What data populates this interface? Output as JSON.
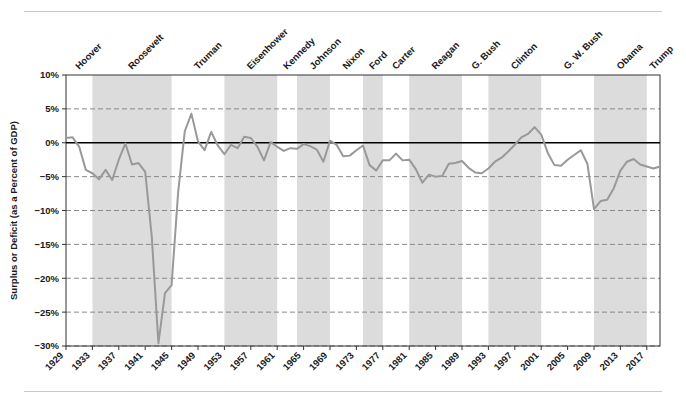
{
  "chart_data": {
    "type": "line",
    "title": "",
    "xlabel": "",
    "ylabel": "Surplus or Deficit (as a Percent of GDP)",
    "ylim": [
      -30,
      10
    ],
    "xlim": [
      1929,
      2019
    ],
    "grid": true,
    "legend_position": "none",
    "y_ticks": [
      "10%",
      "5%",
      "0%",
      "-5%",
      "-10%",
      "-15%",
      "-20%",
      "-25%",
      "-30%"
    ],
    "y_tick_values": [
      10,
      5,
      0,
      -5,
      -10,
      -15,
      -20,
      -25,
      -30
    ],
    "x_ticks": [
      "1929",
      "1933",
      "1937",
      "1941",
      "1945",
      "1949",
      "1953",
      "1957",
      "1961",
      "1965",
      "1969",
      "1973",
      "1977",
      "1981",
      "1985",
      "1989",
      "1993",
      "1997",
      "2001",
      "2005",
      "2009",
      "2013",
      "2017"
    ],
    "x_tick_values": [
      1929,
      1933,
      1937,
      1941,
      1945,
      1949,
      1953,
      1957,
      1961,
      1965,
      1969,
      1973,
      1977,
      1981,
      1985,
      1989,
      1993,
      1997,
      2001,
      2005,
      2009,
      2013,
      2017
    ],
    "series": [
      {
        "name": "Surplus or Deficit (as a Percent of GDP)",
        "color": "#999999",
        "x": [
          1929,
          1930,
          1931,
          1932,
          1933,
          1934,
          1935,
          1936,
          1937,
          1938,
          1939,
          1940,
          1941,
          1942,
          1943,
          1944,
          1945,
          1946,
          1947,
          1948,
          1949,
          1950,
          1951,
          1952,
          1953,
          1954,
          1955,
          1956,
          1957,
          1958,
          1959,
          1960,
          1961,
          1962,
          1963,
          1964,
          1965,
          1966,
          1967,
          1968,
          1969,
          1970,
          1971,
          1972,
          1973,
          1974,
          1975,
          1976,
          1977,
          1978,
          1979,
          1980,
          1981,
          1982,
          1983,
          1984,
          1985,
          1986,
          1987,
          1988,
          1989,
          1990,
          1991,
          1992,
          1993,
          1994,
          1995,
          1996,
          1997,
          1998,
          1999,
          2000,
          2001,
          2002,
          2003,
          2004,
          2005,
          2006,
          2007,
          2008,
          2009,
          2010,
          2011,
          2012,
          2013,
          2014,
          2015,
          2016,
          2017,
          2018,
          2019
        ],
        "values": [
          0.7,
          0.8,
          -0.6,
          -4.0,
          -4.5,
          -5.4,
          -4.0,
          -5.5,
          -2.5,
          -0.1,
          -3.2,
          -3.0,
          -4.3,
          -13.9,
          -29.6,
          -22.2,
          -21.0,
          -7.2,
          1.7,
          4.3,
          0.2,
          -1.1,
          1.6,
          -0.4,
          -1.7,
          -0.3,
          -0.8,
          0.9,
          0.7,
          -0.6,
          -2.6,
          0.1,
          -0.6,
          -1.2,
          -0.8,
          -0.9,
          -0.2,
          -0.5,
          -1.0,
          -2.8,
          0.3,
          -0.3,
          -2.0,
          -1.9,
          -1.1,
          -0.4,
          -3.3,
          -4.1,
          -2.6,
          -2.6,
          -1.6,
          -2.6,
          -2.5,
          -3.9,
          -5.9,
          -4.7,
          -5.0,
          -4.9,
          -3.1,
          -3.0,
          -2.7,
          -3.7,
          -4.4,
          -4.5,
          -3.8,
          -2.8,
          -2.2,
          -1.3,
          -0.3,
          0.8,
          1.3,
          2.3,
          1.2,
          -1.5,
          -3.3,
          -3.4,
          -2.5,
          -1.8,
          -1.1,
          -3.1,
          -9.8,
          -8.6,
          -8.4,
          -6.7,
          -4.1,
          -2.8,
          -2.4,
          -3.2,
          -3.5,
          -3.8,
          -3.5
        ]
      }
    ],
    "shaded_bands": [
      {
        "label": "Hoover",
        "start": 1929,
        "end": 1933,
        "shaded": false
      },
      {
        "label": "Roosevelt",
        "start": 1933,
        "end": 1945,
        "shaded": true
      },
      {
        "label": "Truman",
        "start": 1945,
        "end": 1953,
        "shaded": false
      },
      {
        "label": "Eisenhower",
        "start": 1953,
        "end": 1961,
        "shaded": true
      },
      {
        "label": "Kennedy",
        "start": 1961,
        "end": 1964,
        "shaded": false
      },
      {
        "label": "Johnson",
        "start": 1964,
        "end": 1969,
        "shaded": true
      },
      {
        "label": "Nixon",
        "start": 1969,
        "end": 1974,
        "shaded": false
      },
      {
        "label": "Ford",
        "start": 1974,
        "end": 1977,
        "shaded": true
      },
      {
        "label": "Carter",
        "start": 1977,
        "end": 1981,
        "shaded": false
      },
      {
        "label": "Reagan",
        "start": 1981,
        "end": 1989,
        "shaded": true
      },
      {
        "label": "G. Bush",
        "start": 1989,
        "end": 1993,
        "shaded": false
      },
      {
        "label": "Clinton",
        "start": 1993,
        "end": 2001,
        "shaded": true
      },
      {
        "label": "G. W. Bush",
        "start": 2001,
        "end": 2009,
        "shaded": false
      },
      {
        "label": "Obama",
        "start": 2009,
        "end": 2017,
        "shaded": true
      },
      {
        "label": "Trump",
        "start": 2017,
        "end": 2019,
        "shaded": false
      }
    ],
    "colors": {
      "line": "#999999",
      "band_shaded": "#dcdcdc",
      "band_plain": "#ffffff",
      "axis": "#333333",
      "gridline": "#888888",
      "zero_line": "#000000",
      "rule": "#c9c9c9",
      "text": "#1a1a1a"
    }
  }
}
